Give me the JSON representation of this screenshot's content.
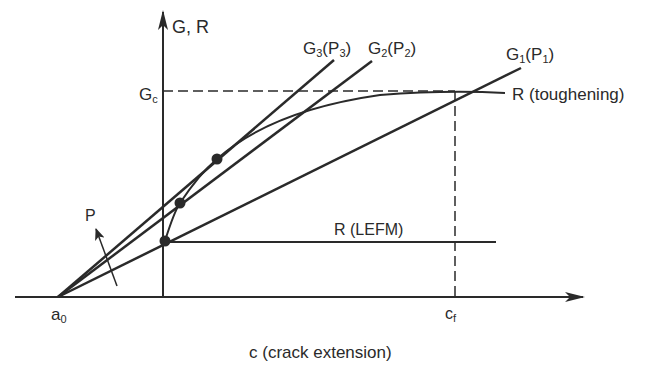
{
  "diagram": {
    "title": "",
    "axes": {
      "y_label": "G, R",
      "x_label": "c (crack extension)",
      "origin_label": {
        "main": "a",
        "sub": "0"
      },
      "cf_label": {
        "main": "c",
        "sub": "f"
      },
      "gc_label": {
        "main": "G",
        "sub": "c"
      }
    },
    "lines": [
      {
        "id": "G1",
        "main": "G",
        "sub1": "1",
        "paren_main": "P",
        "sub2": "1"
      },
      {
        "id": "G2",
        "main": "G",
        "sub1": "2",
        "paren_main": "P",
        "sub2": "2"
      },
      {
        "id": "G3",
        "main": "G",
        "sub1": "3",
        "paren_main": "P",
        "sub2": "3"
      }
    ],
    "curves": {
      "r_toughening": "R (toughening)",
      "r_lefm": "R (LEFM)"
    },
    "load_arrow_label": "P",
    "colors": {
      "ink": "#2a2a2a",
      "background": "#ffffff"
    }
  }
}
